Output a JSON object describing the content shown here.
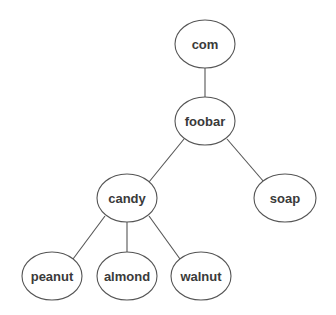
{
  "diagram": {
    "type": "tree",
    "colors": {
      "background": "#ffffff",
      "stroke": "#555555",
      "text": "#3a3a3a"
    },
    "nodes": [
      {
        "id": "com",
        "label": "com",
        "cx": 205,
        "cy": 44,
        "rx": 30,
        "ry": 24
      },
      {
        "id": "foobar",
        "label": "foobar",
        "cx": 205,
        "cy": 121,
        "rx": 30,
        "ry": 24
      },
      {
        "id": "candy",
        "label": "candy",
        "cx": 127,
        "cy": 198,
        "rx": 30,
        "ry": 24
      },
      {
        "id": "soap",
        "label": "soap",
        "cx": 285,
        "cy": 198,
        "rx": 31,
        "ry": 24
      },
      {
        "id": "peanut",
        "label": "peanut",
        "cx": 52,
        "cy": 276,
        "rx": 30,
        "ry": 24
      },
      {
        "id": "almond",
        "label": "almond",
        "cx": 127,
        "cy": 276,
        "rx": 30,
        "ry": 24
      },
      {
        "id": "walnut",
        "label": "walnut",
        "cx": 201,
        "cy": 276,
        "rx": 30,
        "ry": 24
      }
    ],
    "edges": [
      {
        "from": "com",
        "to": "foobar",
        "x1": 205,
        "y1": 68,
        "x2": 205,
        "y2": 97
      },
      {
        "from": "foobar",
        "to": "candy",
        "x1": 184,
        "y1": 139,
        "x2": 149,
        "y2": 182
      },
      {
        "from": "foobar",
        "to": "soap",
        "x1": 227,
        "y1": 139,
        "x2": 264,
        "y2": 182
      },
      {
        "from": "candy",
        "to": "peanut",
        "x1": 105,
        "y1": 216,
        "x2": 73,
        "y2": 259
      },
      {
        "from": "candy",
        "to": "almond",
        "x1": 127,
        "y1": 222,
        "x2": 127,
        "y2": 252
      },
      {
        "from": "candy",
        "to": "walnut",
        "x1": 149,
        "y1": 216,
        "x2": 180,
        "y2": 259
      }
    ]
  }
}
